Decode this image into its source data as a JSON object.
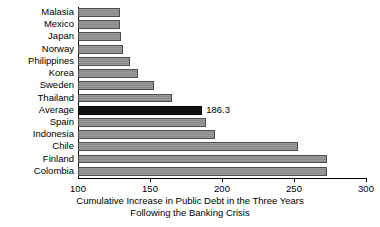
{
  "chart_data": {
    "type": "bar",
    "orientation": "horizontal",
    "title": "",
    "xlabel": "Cumulative Increase in Public Debt in the Three Years Following the Banking Crisis",
    "xlabel_line1": "Cumulative Increase in Public Debt in the Three Years",
    "xlabel_line2": "Following the Banking Crisis",
    "ylabel": "",
    "categories": [
      "Malasia",
      "Mexico",
      "Japan",
      "Norway",
      "Philippines",
      "Korea",
      "Sweden",
      "Thailand",
      "Average",
      "Spain",
      "Indonesia",
      "Chile",
      "Finland",
      "Colombia"
    ],
    "values": [
      129,
      129,
      130,
      131,
      136,
      142,
      153,
      165,
      186.3,
      189,
      195,
      253,
      273,
      273
    ],
    "data_labels": [
      "",
      "",
      "",
      "",
      "",
      "",
      "",
      "",
      "186.3",
      "",
      "",
      "",
      "",
      ""
    ],
    "highlight_category": "Average",
    "highlight_value": "186.3",
    "xlim": [
      100,
      300
    ],
    "xticks": [
      100,
      150,
      200,
      250,
      300
    ],
    "xtick_labels": [
      "100",
      "150",
      "200",
      "250",
      "300"
    ],
    "grid": false,
    "legend": null,
    "colors": {
      "bar_fill": "#9a9a9a",
      "bar_edge": "#4d4d4d",
      "highlight_fill": "#111111",
      "axis": "#000000",
      "background": "#ffffff",
      "text": "#000000"
    }
  }
}
